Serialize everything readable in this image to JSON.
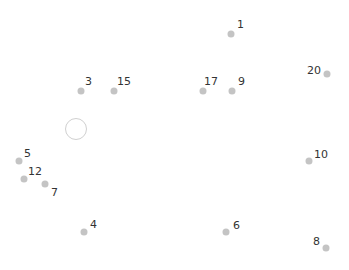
{
  "puzzle": {
    "type": "connect-the-dots",
    "dot_color": "#c4c4c4",
    "label_color": "#333333",
    "dots": [
      {
        "n": "1",
        "x": 231,
        "y": 34,
        "lx": 237,
        "ly": 24
      },
      {
        "n": "3",
        "x": 81,
        "y": 91,
        "lx": 85,
        "ly": 81
      },
      {
        "n": "15",
        "x": 114,
        "y": 91,
        "lx": 117,
        "ly": 81
      },
      {
        "n": "17",
        "x": 203,
        "y": 91,
        "lx": 204,
        "ly": 81
      },
      {
        "n": "9",
        "x": 232,
        "y": 91,
        "lx": 238,
        "ly": 81
      },
      {
        "n": "20",
        "x": 327,
        "y": 74,
        "lx": 307,
        "ly": 70
      },
      {
        "n": "5",
        "x": 19,
        "y": 161,
        "lx": 24,
        "ly": 153
      },
      {
        "n": "12",
        "x": 24,
        "y": 179,
        "lx": 28,
        "ly": 171
      },
      {
        "n": "7",
        "x": 45,
        "y": 184,
        "lx": 51,
        "ly": 192
      },
      {
        "n": "10",
        "x": 309,
        "y": 161,
        "lx": 314,
        "ly": 154
      },
      {
        "n": "4",
        "x": 84,
        "y": 232,
        "lx": 90,
        "ly": 224
      },
      {
        "n": "6",
        "x": 226,
        "y": 232,
        "lx": 233,
        "ly": 225
      },
      {
        "n": "8",
        "x": 326,
        "y": 248,
        "lx": 313,
        "ly": 241
      }
    ],
    "cursor": {
      "x": 76,
      "y": 129
    }
  }
}
